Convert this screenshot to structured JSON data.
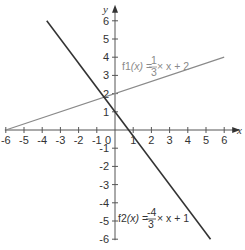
{
  "chart_data": {
    "type": "line",
    "title": "",
    "xlabel": "x",
    "ylabel": "y",
    "xlim": [
      -6,
      6
    ],
    "ylim": [
      -6,
      6
    ],
    "grid": false,
    "x_ticks": [
      -6,
      -5,
      -4,
      -3,
      -2,
      -1,
      0,
      1,
      2,
      3,
      4,
      5,
      6
    ],
    "y_ticks": [
      -6,
      -5,
      -4,
      -3,
      -2,
      -1,
      1,
      2,
      3,
      4,
      5,
      6
    ],
    "series": [
      {
        "name": "f1",
        "label": "f1(x) = 1/3 × x + 2",
        "slope": 0.3333,
        "intercept": 2,
        "x": [
          -6,
          6
        ],
        "values": [
          0,
          4
        ],
        "color": "#8a8a8a"
      },
      {
        "name": "f2",
        "label": "f2(x) = -4/3 × x + 1",
        "slope": -1.3333,
        "intercept": 1,
        "x": [
          -3.75,
          5.25
        ],
        "values": [
          6,
          -6
        ],
        "color": "#333333"
      }
    ],
    "annotations": [
      {
        "text": "f1(x) = 1/3 × x + 2",
        "x": 0.3,
        "y": 3.5
      },
      {
        "text": "f2(x) = -4/3 × x + 1",
        "x": 0.3,
        "y": -4.7
      }
    ]
  },
  "labels": {
    "x_axis": "x",
    "y_axis": "y",
    "origin": "0",
    "f1": {
      "name": "f1",
      "arg": "(x)",
      "eq": " = ",
      "num": "1",
      "den": "3",
      "rest": " × x + 2"
    },
    "f2": {
      "name": "f2",
      "arg": "(x)",
      "eq": " = ",
      "num": "-4",
      "den": "3",
      "rest": " × x + 1"
    }
  }
}
